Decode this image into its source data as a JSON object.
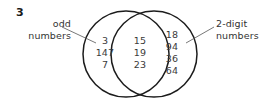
{
  "exercise": {
    "number": "3"
  },
  "diagram": {
    "type": "venn-two-set",
    "stroke_color": "#1c1c1c",
    "text_color": "#3a3a3a",
    "label_color": "#333333",
    "background": "#ffffff",
    "left_circle": {
      "cx": 126,
      "cy": 54,
      "r": 43
    },
    "right_circle": {
      "cx": 154,
      "cy": 54,
      "r": 43
    },
    "sets": {
      "left": {
        "label_lines": [
          "odd",
          "numbers"
        ],
        "leader": {
          "x1": 62,
          "y1": 27,
          "x2": 96,
          "y2": 43
        }
      },
      "right": {
        "label_lines": [
          "2-digit",
          "numbers"
        ],
        "leader": {
          "x1": 214,
          "y1": 27,
          "x2": 186,
          "y2": 43
        }
      }
    },
    "regions": {
      "left_only": {
        "values": [
          "3",
          "147",
          "7"
        ]
      },
      "intersection": {
        "values": [
          "15",
          "19",
          "23"
        ]
      },
      "right_only": {
        "values": [
          "18",
          "94",
          "36",
          "64"
        ]
      }
    }
  }
}
